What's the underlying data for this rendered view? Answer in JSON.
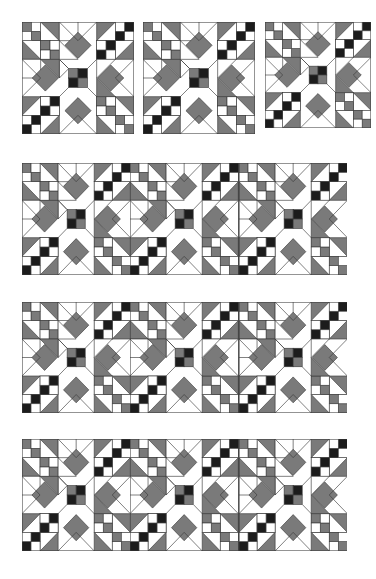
{
  "figure": {
    "colors": {
      "background": "#ffffff",
      "light": "#ffffff",
      "medium": "#7a7a7a",
      "dark": "#1c1c1c",
      "line": "#3a3a3a"
    },
    "singles": [
      {
        "x": 22,
        "y": 22,
        "size": 112
      },
      {
        "x": 143,
        "y": 22,
        "size": 112
      },
      {
        "x": 265,
        "y": 22,
        "size": 106
      }
    ],
    "banners": [
      {
        "x": 22,
        "y": 163,
        "width": 325,
        "height": 112,
        "blocks": 3
      },
      {
        "x": 22,
        "y": 302,
        "width": 325,
        "height": 111,
        "blocks": 3
      },
      {
        "x": 22,
        "y": 439,
        "width": 325,
        "height": 112,
        "blocks": 3
      }
    ],
    "block_grid": 6
  }
}
